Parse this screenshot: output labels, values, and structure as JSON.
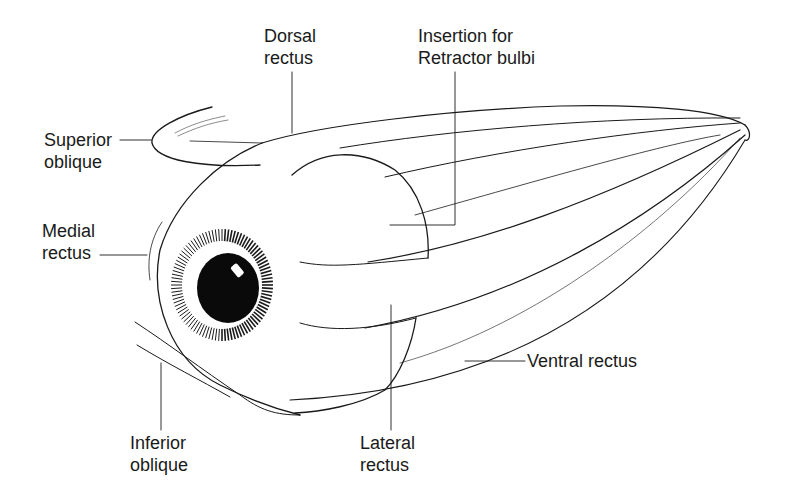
{
  "figure": {
    "colors": {
      "ink": "#1a1a1a",
      "background": "#ffffff"
    },
    "labels": [
      {
        "id": "dorsal-rectus",
        "lines": [
          "Dorsal",
          "rectus"
        ]
      },
      {
        "id": "insertion-retractor-bulbi",
        "lines": [
          "Insertion for",
          "Retractor bulbi"
        ]
      },
      {
        "id": "superior-oblique",
        "lines": [
          "Superior",
          "oblique"
        ]
      },
      {
        "id": "medial-rectus",
        "lines": [
          "Medial",
          "rectus"
        ]
      },
      {
        "id": "ventral-rectus",
        "lines": [
          "Ventral rectus"
        ]
      },
      {
        "id": "inferior-oblique",
        "lines": [
          "Inferior",
          "oblique"
        ]
      },
      {
        "id": "lateral-rectus",
        "lines": [
          "Lateral",
          "rectus"
        ]
      }
    ]
  }
}
